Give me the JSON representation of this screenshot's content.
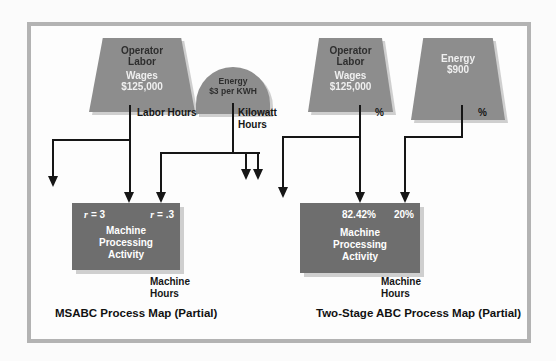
{
  "colors": {
    "shape_fill": "#8d8d8d",
    "box_fill": "#6e6e6e",
    "frame": "#b3b3b3",
    "shadow": "#cfcfcf",
    "line": "#161616",
    "text_dark": "#2e2e2e",
    "text_light": "#efefef"
  },
  "left": {
    "caption": "MSABC Process Map (Partial)",
    "labor_pool": {
      "line1": "Operator",
      "line2": "Labor",
      "line3": "Wages",
      "line4": "$125,000"
    },
    "energy_pool": {
      "line1": "Energy",
      "line2": "$3 per KWH"
    },
    "labor_driver_label": "Labor Hours",
    "energy_driver_label": {
      "line1": "Kilowatt",
      "line2": "Hours"
    },
    "activity": {
      "rate_left_var": "r",
      "rate_left_eq": "= 3",
      "rate_right_var": "r",
      "rate_right_eq": "= .3",
      "name1": "Machine",
      "name2": "Processing",
      "name3": "Activity"
    },
    "output_label": {
      "line1": "Machine",
      "line2": "Hours"
    }
  },
  "right": {
    "caption": "Two-Stage ABC Process Map (Partial)",
    "labor_pool": {
      "line1": "Operator",
      "line2": "Labor",
      "line3": "Wages",
      "line4": "$125,000"
    },
    "energy_pool": {
      "line1": "Energy",
      "line2": "$900"
    },
    "labor_driver_label": "%",
    "energy_driver_label": "%",
    "activity": {
      "pct_left": "82.42%",
      "pct_right": "20%",
      "name1": "Machine",
      "name2": "Processing",
      "name3": "Activity"
    },
    "output_label": {
      "line1": "Machine",
      "line2": "Hours"
    }
  }
}
